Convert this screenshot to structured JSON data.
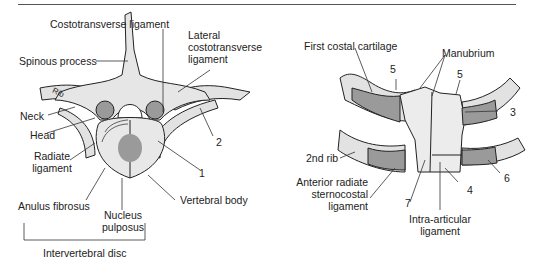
{
  "figure": {
    "left_panel": {
      "name": "costovertebral joint (superior view)",
      "labels": {
        "costotransverse_ligament": "Costotransverse ligament",
        "lateral_costotransverse_ligament_1": "Lateral",
        "lateral_costotransverse_ligament_2": "costotransverse",
        "lateral_costotransverse_ligament_3": "ligament",
        "spinous_process": "Spinous process",
        "rib": "Rib",
        "neck": "Neck",
        "head": "Head",
        "radiate_ligament_1": "Radiate",
        "radiate_ligament_2": "ligament",
        "anulus_fibrosus": "Anulus fibrosus",
        "nucleus_pulposus_1": "Nucleus",
        "nucleus_pulposus_2": "pulposus",
        "vertebral_body": "Vertebral body",
        "intervertebral_disc": "Intervertebral disc",
        "num_1": "1",
        "num_2": "2"
      }
    },
    "right_panel": {
      "name": "sternocostal joints (anterior view)",
      "labels": {
        "first_costal_cartilage": "First costal cartilage",
        "manubrium": "Manubrium",
        "num_5a": "5",
        "num_5b": "5",
        "num_3": "3",
        "second_rib": "2nd rib",
        "anterior_radiate_1": "Anterior radiate",
        "anterior_radiate_2": "sternocostal",
        "anterior_radiate_3": "ligament",
        "num_7": "7",
        "num_4": "4",
        "num_6": "6",
        "intra_articular_1": "Intra-articular",
        "intra_articular_2": "ligament"
      }
    },
    "colors": {
      "bone": "#e6e6e6",
      "cartilage": "#9a9a9a",
      "dark": "#7a7a7a",
      "outline": "#222222",
      "rule": "#555555"
    }
  }
}
